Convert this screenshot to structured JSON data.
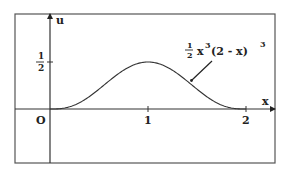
{
  "chart_data": {
    "type": "line",
    "title": "",
    "xlabel": "x",
    "ylabel": "u",
    "series": [
      {
        "name": "1/2 x^3 (2 - x)^3",
        "function": "0.5 * x^3 * (2 - x)^3",
        "x": [
          0,
          0.25,
          0.5,
          0.75,
          1.0,
          1.25,
          1.5,
          1.75,
          2.0
        ],
        "values": [
          0,
          0.0052,
          0.0527,
          0.1545,
          0.5,
          0.1545,
          0.0527,
          0.0052,
          0
        ]
      }
    ],
    "x_ticks": [
      "0",
      "1",
      "2"
    ],
    "y_ticks": [
      "1/2"
    ],
    "xlim": [
      -0.36,
      2.3
    ],
    "ylim": [
      -0.57,
      1.0
    ],
    "grid": false,
    "legend": "none",
    "annotations": [
      {
        "text": "1/2 x^3 (2 - x)^3",
        "points_to": "curve near x = 1.45"
      }
    ]
  },
  "axes": {
    "x_label": "x",
    "u_label": "u",
    "origin_label": "O",
    "tick_1": "1",
    "tick_2": "2",
    "half_num": "1",
    "half_den": "2"
  },
  "annotation": {
    "coef_num": "1",
    "coef_den": "2",
    "base1": "x",
    "exp1": "3",
    "paren": "(2 - x)",
    "exp2": "3"
  },
  "colors": {
    "line": "#333333",
    "frame": "#555555",
    "background": "#ffffff"
  }
}
